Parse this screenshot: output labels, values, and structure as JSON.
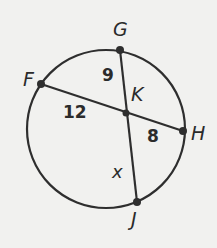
{
  "diagram": {
    "type": "circle-intersecting-chords",
    "colors": {
      "stroke": "#2e2e2e",
      "background": "#f1f1ef"
    },
    "circle": {
      "cx": 106,
      "cy": 129,
      "r": 79
    },
    "points": {
      "F": {
        "label": "F",
        "x": 41,
        "y": 84
      },
      "G": {
        "label": "G",
        "x": 120,
        "y": 50
      },
      "H": {
        "label": "H",
        "x": 183,
        "y": 131
      },
      "J": {
        "label": "J",
        "x": 137,
        "y": 202
      },
      "K": {
        "label": "K",
        "x": 126,
        "y": 113
      }
    },
    "chords": [
      {
        "name": "FH",
        "from": "F",
        "to": "H"
      },
      {
        "name": "GJ",
        "from": "G",
        "to": "J"
      }
    ],
    "segment_labels": {
      "GK": "9",
      "FK": "12",
      "KH": "8",
      "KJ": "x"
    }
  }
}
